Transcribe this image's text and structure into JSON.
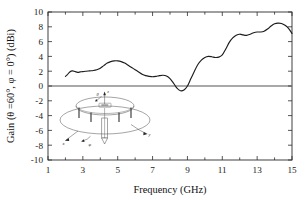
{
  "chart_data": {
    "type": "line",
    "title": "",
    "xlabel": "Frequency (GHz)",
    "ylabel": "Gain (θ =60°, φ = 0°) (dBi)",
    "xlim": [
      1,
      15
    ],
    "ylim": [
      -10,
      10
    ],
    "grid": false,
    "legend": "none",
    "xticks": [
      1,
      3,
      5,
      7,
      9,
      11,
      13,
      15
    ],
    "xtick_labels": [
      "1",
      "3",
      "5",
      "7",
      "9",
      "11",
      "13",
      "15"
    ],
    "xminor_ticks": [
      2,
      4,
      6,
      8,
      10,
      12,
      14
    ],
    "yticks": [
      -10,
      -8,
      -6,
      -4,
      -2,
      0,
      2,
      4,
      6,
      8,
      10
    ],
    "ytick_labels": [
      "-10",
      "-8",
      "-6",
      "-4",
      "-2",
      "0",
      "2",
      "4",
      "6",
      "8",
      "10"
    ],
    "zero_reference_line": 0,
    "series": [
      {
        "name": "Gain",
        "x": [
          2.0,
          2.1,
          2.25,
          2.4,
          2.55,
          2.7,
          2.85,
          3.0,
          3.2,
          3.4,
          3.6,
          3.8,
          4.0,
          4.2,
          4.4,
          4.6,
          4.8,
          5.0,
          5.2,
          5.4,
          5.6,
          5.8,
          6.0,
          6.2,
          6.4,
          6.6,
          6.8,
          7.0,
          7.2,
          7.4,
          7.6,
          7.8,
          8.0,
          8.2,
          8.4,
          8.6,
          8.8,
          9.0,
          9.2,
          9.4,
          9.6,
          9.8,
          10.0,
          10.2,
          10.4,
          10.6,
          10.8,
          11.0,
          11.2,
          11.4,
          11.6,
          11.8,
          12.0,
          12.2,
          12.4,
          12.6,
          12.8,
          13.0,
          13.2,
          13.4,
          13.6,
          13.8,
          14.0,
          14.2,
          14.4,
          14.6,
          14.8,
          15.0
        ],
        "y": [
          1.3,
          1.5,
          1.9,
          2.05,
          1.95,
          1.85,
          1.9,
          1.95,
          2.0,
          2.05,
          2.1,
          2.2,
          2.4,
          2.75,
          3.1,
          3.3,
          3.4,
          3.4,
          3.3,
          3.1,
          2.8,
          2.5,
          2.2,
          1.9,
          1.6,
          1.4,
          1.3,
          1.25,
          1.3,
          1.4,
          1.45,
          1.35,
          1.0,
          0.4,
          -0.3,
          -0.65,
          -0.55,
          0.0,
          1.0,
          2.0,
          2.9,
          3.5,
          3.85,
          4.0,
          3.95,
          3.85,
          3.9,
          4.2,
          5.0,
          5.9,
          6.5,
          6.85,
          7.0,
          6.9,
          6.85,
          7.0,
          7.2,
          7.3,
          7.3,
          7.4,
          7.7,
          8.1,
          8.4,
          8.5,
          8.45,
          8.2,
          7.8,
          7.1
        ],
        "color": "#1d1d1d"
      }
    ]
  },
  "inset": {
    "name": "antenna-geometry-diagram",
    "labels": {
      "theta": "θ",
      "z": "z",
      "x": "x",
      "phi": "φ",
      "y": "y"
    },
    "colors": {
      "ground_plane": "#ebebeb",
      "patch_disc": "#b5b5b5",
      "inner_slot": "#d8d8d8",
      "outline": "#4a4a4a",
      "post": "#2e2e2e"
    }
  },
  "colors": {
    "axis": "#2b2b2b",
    "curve": "#1d1d1d",
    "zero_line": "#8c8c8c",
    "background": "#ffffff"
  }
}
